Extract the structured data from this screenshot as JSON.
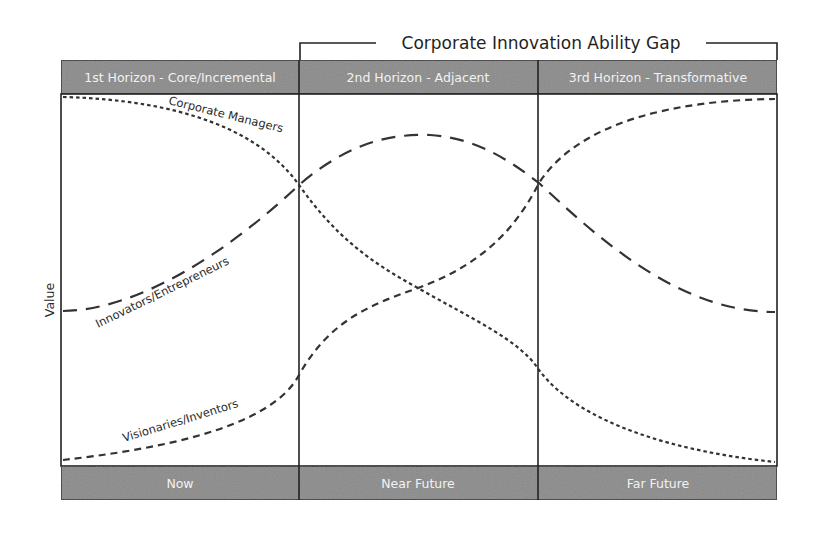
{
  "diagram": {
    "bracket": {
      "title": "Corporate Innovation Ability Gap"
    },
    "horizons": [
      {
        "label": "1st Horizon - Core/Incremental"
      },
      {
        "label": "2nd Horizon - Adjacent"
      },
      {
        "label": "3rd Horizon - Transformative"
      }
    ],
    "timeframes": [
      {
        "label": "Now"
      },
      {
        "label": "Near Future"
      },
      {
        "label": "Far Future"
      }
    ],
    "y_axis_label": "Value",
    "curves": [
      {
        "name": "Corporate Managers",
        "style": "dotted",
        "label": "Corporate Managers"
      },
      {
        "name": "Innovators/Entrepreneurs",
        "style": "long-dash",
        "label": "Innovators/Entrepreneurs"
      },
      {
        "name": "Visionaries/Inventors",
        "style": "short-dash",
        "label": "Visionaries/Inventors"
      }
    ],
    "colors": {
      "band_fill": "#8a8a8a",
      "band_text": "#f2f2f2",
      "border": "#222222",
      "curve": "#333333",
      "background": "#ffffff"
    }
  }
}
